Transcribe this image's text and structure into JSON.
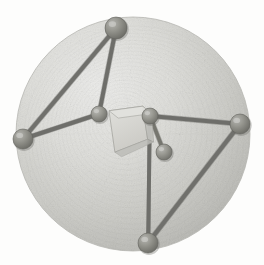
{
  "figure": {
    "width": 264,
    "height": 265,
    "background_color": "#fdfdfc"
  },
  "sphere": {
    "name": "enclosing-sphere",
    "center_x": 133,
    "center_y": 134,
    "radius": 117,
    "fill_color": "#cfcfcb",
    "highlight_color": "#e4e4e0",
    "shadow_color": "#adada8",
    "edge_color": "#b6b6b1",
    "texture": "fine-stipple-noise",
    "texture_opacity": 0.42
  },
  "core": {
    "name": "central-polyhedron",
    "label": "central cube",
    "center_x": 130,
    "center_y": 131,
    "face_color": "#d8d8d3",
    "side_color": "#c2c2bd",
    "top_color": "#e2e2de",
    "edge_color": "#9d9d98",
    "width": 42,
    "height": 46
  },
  "atoms": [
    {
      "id": "a1",
      "label": "top-vertex-atom",
      "x": 116,
      "y": 28,
      "r": 11,
      "color": "#8d8d88",
      "type": "outer"
    },
    {
      "id": "a2",
      "label": "left-vertex-atom",
      "x": 23,
      "y": 139,
      "r": 10,
      "color": "#8d8d88",
      "type": "outer"
    },
    {
      "id": "a3",
      "label": "right-vertex-atom",
      "x": 240,
      "y": 124,
      "r": 10,
      "color": "#8d8d88",
      "type": "outer"
    },
    {
      "id": "a4",
      "label": "bottom-vertex-atom",
      "x": 148,
      "y": 243,
      "r": 10,
      "color": "#8d8d88",
      "type": "outer"
    },
    {
      "id": "a5",
      "label": "inner-left-atom",
      "x": 99,
      "y": 114,
      "r": 8,
      "color": "#939390",
      "type": "inner"
    },
    {
      "id": "a6",
      "label": "inner-upper-atom",
      "x": 150,
      "y": 116,
      "r": 8,
      "color": "#8f8f8b",
      "type": "inner"
    },
    {
      "id": "a7",
      "label": "inner-lower-atom",
      "x": 164,
      "y": 152,
      "r": 8,
      "color": "#8f8f8b",
      "type": "inner"
    }
  ],
  "bonds": [
    {
      "id": "b1",
      "label": "top-to-left-bond",
      "from": "a1",
      "to": "a2",
      "width": 4.2,
      "color": "#70706c"
    },
    {
      "id": "b2",
      "label": "top-to-core-bond",
      "from": "a1",
      "to": "a5",
      "width": 4.0,
      "color": "#6e6e6a"
    },
    {
      "id": "b3",
      "label": "left-to-core-bond",
      "from": "a2",
      "to": "a5",
      "width": 4.0,
      "color": "#6e6e6a"
    },
    {
      "id": "b4",
      "label": "core-to-right-bond",
      "from": "a6",
      "to": "a3",
      "width": 4.0,
      "color": "#6e6e6a"
    },
    {
      "id": "b5",
      "label": "right-to-bottom-bond",
      "from": "a3",
      "to": "a4",
      "width": 4.2,
      "color": "#70706c"
    },
    {
      "id": "b6",
      "label": "core-to-bottom-bond",
      "from": "a6",
      "to": "a4",
      "width": 4.0,
      "color": "#6e6e6a"
    },
    {
      "id": "b7",
      "label": "inner-upper-lower-bond",
      "from": "a6",
      "to": "a7",
      "width": 3.6,
      "color": "#76766f"
    }
  ]
}
